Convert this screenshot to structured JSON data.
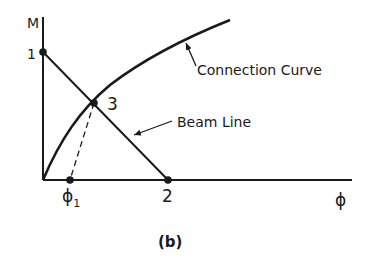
{
  "figure": {
    "caption": "(b)",
    "axes": {
      "y_label": "M",
      "x_label": "ϕ"
    },
    "points": {
      "p1": "1",
      "p2": "2",
      "p3": "3",
      "phi1_base": "ϕ",
      "phi1_sub": "1"
    },
    "annotations": {
      "connection_curve": "Connection Curve",
      "beam_line": "Beam Line"
    },
    "colors": {
      "ink": "#1a1a1a",
      "background": "#ffffff"
    }
  }
}
